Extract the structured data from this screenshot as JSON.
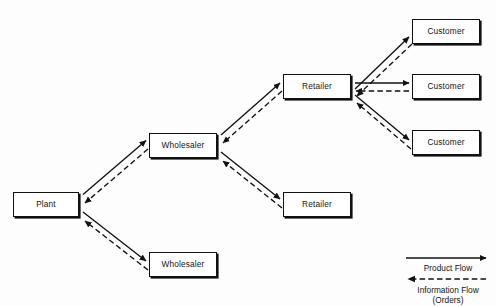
{
  "diagram": {
    "type": "flow-diagram",
    "background_color": "#fdfdfd",
    "line_color": "#111111",
    "box_fill_color": "#ffffff",
    "nodes": [
      {
        "id": "plant",
        "label": "Plant",
        "x": 13,
        "y": 192,
        "w": 66,
        "h": 25
      },
      {
        "id": "wholesaler-top",
        "label": "Wholesaler",
        "x": 149,
        "y": 133,
        "w": 68,
        "h": 25
      },
      {
        "id": "wholesaler-bottom",
        "label": "Wholesaler",
        "x": 149,
        "y": 252,
        "w": 68,
        "h": 25
      },
      {
        "id": "retailer-top",
        "label": "Retailer",
        "x": 283,
        "y": 74,
        "w": 68,
        "h": 25
      },
      {
        "id": "retailer-bottom",
        "label": "Retailer",
        "x": 283,
        "y": 192,
        "w": 68,
        "h": 25
      },
      {
        "id": "customer-1",
        "label": "Customer",
        "x": 412,
        "y": 19,
        "w": 68,
        "h": 25
      },
      {
        "id": "customer-2",
        "label": "Customer",
        "x": 412,
        "y": 74,
        "w": 68,
        "h": 25
      },
      {
        "id": "customer-3",
        "label": "Customer",
        "x": 412,
        "y": 130,
        "w": 68,
        "h": 25
      }
    ],
    "links": [
      {
        "from": "plant",
        "to": "wholesaler-top",
        "product_flow": "downstream",
        "information_flow": "upstream"
      },
      {
        "from": "plant",
        "to": "wholesaler-bottom",
        "product_flow": "downstream",
        "information_flow": "upstream"
      },
      {
        "from": "wholesaler-top",
        "to": "retailer-top",
        "product_flow": "downstream",
        "information_flow": "upstream"
      },
      {
        "from": "wholesaler-top",
        "to": "retailer-bottom",
        "product_flow": "downstream",
        "information_flow": "upstream"
      },
      {
        "from": "retailer-top",
        "to": "customer-1",
        "product_flow": "downstream",
        "information_flow": "upstream"
      },
      {
        "from": "retailer-top",
        "to": "customer-2",
        "product_flow": "downstream",
        "information_flow": "upstream"
      },
      {
        "from": "retailer-top",
        "to": "customer-3",
        "product_flow": "downstream",
        "information_flow": "upstream"
      }
    ]
  },
  "legend": {
    "product_flow_label": "Product Flow",
    "information_flow_label": "Information Flow",
    "information_flow_sublabel": "(Orders)",
    "product_flow_style": "solid",
    "product_flow_direction": "right",
    "information_flow_style": "dashed",
    "information_flow_direction": "left"
  }
}
